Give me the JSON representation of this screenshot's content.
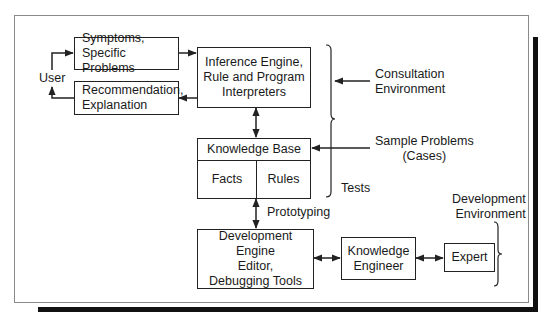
{
  "diagram": {
    "type": "expert-system-architecture",
    "nodes": {
      "user": "User",
      "symptoms": "Symptoms,\nSpecific Problems",
      "recommendation": "Recommendation,\nExplanation",
      "inference_engine": "Inference Engine,\nRule and Program\nInterpreters",
      "knowledge_base": {
        "title": "Knowledge Base",
        "facts": "Facts",
        "rules": "Rules"
      },
      "development_engine": "Development Engine\nEditor,\nDebugging Tools",
      "knowledge_engineer": "Knowledge\nEngineer",
      "expert": "Expert"
    },
    "labels": {
      "consultation_environment": "Consultation\nEnvironment",
      "sample_problems": "Sample Problems\n(Cases)",
      "tests": "Tests",
      "prototyping": "Prototyping",
      "development_environment": "Development\nEnvironment"
    },
    "edges": [
      {
        "from": "user",
        "to": "symptoms",
        "direction": "forward"
      },
      {
        "from": "symptoms",
        "to": "inference_engine",
        "direction": "forward"
      },
      {
        "from": "inference_engine",
        "to": "recommendation",
        "direction": "forward"
      },
      {
        "from": "recommendation",
        "to": "user",
        "direction": "forward"
      },
      {
        "from": "inference_engine",
        "to": "knowledge_base",
        "direction": "both"
      },
      {
        "from": "sample_problems",
        "to": "knowledge_base",
        "direction": "forward"
      },
      {
        "from": "consultation_environment",
        "to": "consultation-brace",
        "direction": "forward"
      },
      {
        "from": "knowledge_base",
        "to": "development_engine",
        "direction": "both",
        "label": "Prototyping"
      },
      {
        "from": "development_engine",
        "to": "knowledge_engineer",
        "direction": "both"
      },
      {
        "from": "knowledge_engineer",
        "to": "expert",
        "direction": "both"
      }
    ],
    "colors": {
      "line": "#222222",
      "frame": "#8a8a8a",
      "shadow": "#111111",
      "background": "#ffffff"
    }
  }
}
